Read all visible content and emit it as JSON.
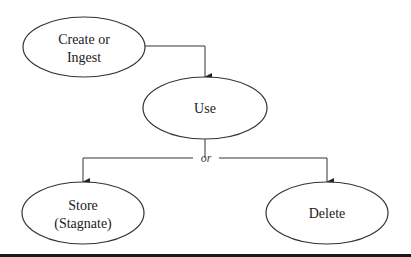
{
  "diagram": {
    "type": "flowchart",
    "nodes": [
      {
        "id": "create",
        "label_line1": "Create or",
        "label_line2": "Ingest"
      },
      {
        "id": "use",
        "label_line1": "Use"
      },
      {
        "id": "store",
        "label_line1": "Store",
        "label_line2": "(Stagnate)"
      },
      {
        "id": "delete",
        "label_line1": "Delete"
      }
    ],
    "edges": [
      {
        "from": "create",
        "to": "use"
      },
      {
        "from": "use",
        "to": "store"
      },
      {
        "from": "use",
        "to": "delete"
      }
    ],
    "branch_label": "or",
    "colors": {
      "stroke": "#333333",
      "background": "#ffffff",
      "bottom_bar": "#1a1a1a"
    }
  }
}
